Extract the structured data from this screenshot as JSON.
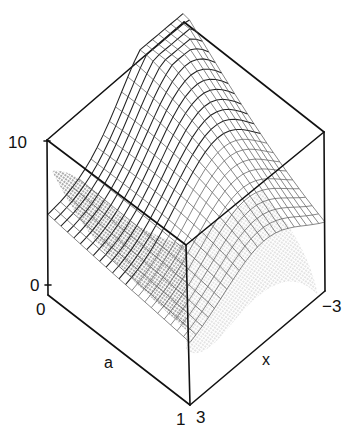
{
  "chart_data": {
    "type": "surface3d",
    "title": "",
    "axes": {
      "a": {
        "label": "a",
        "range": [
          0,
          1
        ],
        "tick_labels": [
          "0",
          "1"
        ]
      },
      "x": {
        "label": "x",
        "range": [
          3,
          -3
        ],
        "tick_labels": [
          "3",
          "-3"
        ]
      },
      "z": {
        "label": "",
        "range": [
          0,
          10
        ],
        "tick_labels": [
          "0",
          "10"
        ]
      }
    },
    "style": {
      "render": "wireframe mesh with stippled shading",
      "box": true,
      "grid": false,
      "legend": false
    },
    "note": "Surface values are not numerically labeled in the figure; only axis ranges and tick labels are readable."
  },
  "labels": {
    "z_top": "10",
    "z_bottom": "0",
    "a_start": "0",
    "a_end": "1",
    "a_axis": "a",
    "x_start": "3",
    "x_end": "−3",
    "x_axis": "x"
  },
  "colors": {
    "ink": "#111111",
    "background": "#ffffff"
  }
}
